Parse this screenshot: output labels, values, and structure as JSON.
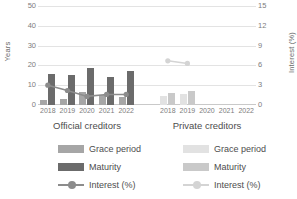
{
  "chart_data": {
    "type": "bar",
    "title": "",
    "categories": [
      "2018",
      "2019",
      "2020",
      "2021",
      "2022"
    ],
    "groups": [
      {
        "name": "Official creditors",
        "series": [
          {
            "name": "Grace period",
            "axis": "left",
            "type": "bar",
            "color": "#a6a6a6",
            "values": [
              2.5,
              3.0,
              6.5,
              5.0,
              4.0
            ]
          },
          {
            "name": "Maturity",
            "axis": "left",
            "type": "bar",
            "color": "#6b6b6b",
            "values": [
              15.5,
              15.0,
              18.5,
              14.0,
              17.0
            ]
          },
          {
            "name": "Interest (%)",
            "axis": "right",
            "type": "line",
            "color": "#8c8c8c",
            "values": [
              3.0,
              2.2,
              1.3,
              1.6,
              1.6
            ]
          }
        ]
      },
      {
        "name": "Private creditors",
        "series": [
          {
            "name": "Grace period",
            "axis": "left",
            "type": "bar",
            "color": "#e2e2e2",
            "values": [
              4.5,
              5.5,
              null,
              null,
              null
            ]
          },
          {
            "name": "Maturity",
            "axis": "left",
            "type": "bar",
            "color": "#c9c9c9",
            "values": [
              6.0,
              7.0,
              null,
              null,
              null
            ]
          },
          {
            "name": "Interest (%)",
            "axis": "right",
            "type": "line",
            "color": "#d4d4d4",
            "values": [
              6.7,
              6.3,
              null,
              null,
              null
            ]
          }
        ]
      }
    ],
    "ylabel": "Years",
    "ylabel_right": "Interest (%)",
    "xlabel": "",
    "ylim": [
      0,
      50
    ],
    "ylim_right": [
      0,
      15
    ],
    "yticks": [
      "50",
      "40",
      "30",
      "20",
      "10",
      "0"
    ],
    "yticks_right": [
      "15",
      "12",
      "9",
      "6",
      "3",
      "0"
    ],
    "grid": true,
    "legend_position": "bottom"
  },
  "axes": {
    "left_title": "Years",
    "right_title": "Interest (%)",
    "left_ticks": [
      "50",
      "40",
      "30",
      "20",
      "10",
      "0"
    ],
    "right_ticks": [
      "15",
      "12",
      "9",
      "6",
      "3",
      "0"
    ],
    "x_ticks_official": [
      "2018",
      "2019",
      "2020",
      "2021",
      "2022"
    ],
    "x_ticks_private": [
      "2018",
      "2019",
      "2020",
      "2021",
      "2022"
    ]
  },
  "captions": {
    "official": "Official creditors",
    "private": "Private creditors"
  },
  "legend": {
    "official": [
      {
        "label": "Grace period",
        "marker": "swatch",
        "color": "#a6a6a6"
      },
      {
        "label": "Maturity",
        "marker": "swatch",
        "color": "#6b6b6b"
      },
      {
        "label": "Interest (%)",
        "marker": "line",
        "color": "#8c8c8c"
      }
    ],
    "private": [
      {
        "label": "Grace period",
        "marker": "swatch",
        "color": "#e2e2e2"
      },
      {
        "label": "Maturity",
        "marker": "swatch",
        "color": "#c9c9c9"
      },
      {
        "label": "Interest (%)",
        "marker": "line",
        "color": "#d4d4d4"
      }
    ]
  },
  "colors": {
    "grid": "#e3e3e3",
    "axis": "#c9c9c9",
    "text": "#7d7d7d",
    "background": "#ffffff"
  }
}
